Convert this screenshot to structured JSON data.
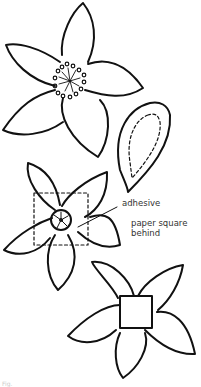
{
  "diagram": {
    "elements": [
      {
        "id": "flower-1",
        "description": "Five-petal flower with stamen center"
      },
      {
        "id": "petal-template",
        "description": "Teardrop petal with dashed inner cut line"
      },
      {
        "id": "flower-2",
        "description": "Five-petal flower with wheel center and dashed paper square behind"
      },
      {
        "id": "flower-3",
        "description": "Five-petal flower with solid square center"
      }
    ],
    "labels": {
      "adhesive": "adhesive",
      "paper_square": "paper square behind"
    },
    "caption": "Fig."
  },
  "colors": {
    "line": "#111111",
    "label_text": "#333333",
    "background": "#ffffff"
  }
}
